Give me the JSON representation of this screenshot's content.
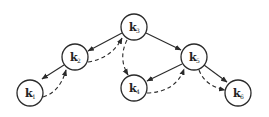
{
  "diagram": {
    "type": "tree-traversal",
    "nodes": [
      {
        "id": "k3",
        "letter": "k",
        "sub": "3",
        "x": 134,
        "y": 27
      },
      {
        "id": "k2",
        "letter": "k",
        "sub": "2",
        "x": 75,
        "y": 57
      },
      {
        "id": "k1",
        "letter": "k",
        "sub": "1",
        "x": 30,
        "y": 93
      },
      {
        "id": "k4",
        "letter": "k",
        "sub": "4",
        "x": 134,
        "y": 88
      },
      {
        "id": "k5",
        "letter": "k",
        "sub": "5",
        "x": 194,
        "y": 57
      },
      {
        "id": "k6",
        "letter": "k",
        "sub": "6",
        "x": 238,
        "y": 93
      }
    ],
    "edges": [
      {
        "from": "k3",
        "to": "k2",
        "style": "solid"
      },
      {
        "from": "k2",
        "to": "k3",
        "style": "dashed"
      },
      {
        "from": "k2",
        "to": "k1",
        "style": "solid"
      },
      {
        "from": "k1",
        "to": "k2",
        "style": "dashed"
      },
      {
        "from": "k3",
        "to": "k4",
        "style": "dashed"
      },
      {
        "from": "k3",
        "to": "k5",
        "style": "solid"
      },
      {
        "from": "k5",
        "to": "k4",
        "style": "solid"
      },
      {
        "from": "k4",
        "to": "k5",
        "style": "dashed"
      },
      {
        "from": "k5",
        "to": "k6",
        "style": "solid"
      },
      {
        "from": "k5",
        "to": "k6",
        "style": "dashed"
      }
    ],
    "colors": {
      "stroke": "#2a2a2a",
      "background": "#ffffff"
    }
  }
}
